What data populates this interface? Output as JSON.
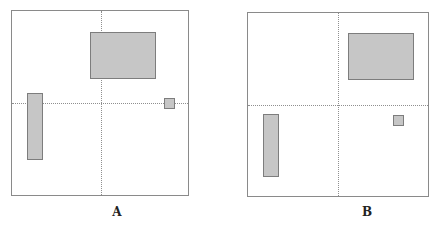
{
  "figure": {
    "shape_fill": "#c6c6c6",
    "shape_border": "#7d7d7d",
    "panels": [
      {
        "label": "A",
        "frame": {
          "x": 11,
          "y": 10,
          "w": 178,
          "h": 186
        },
        "divider_v_x": 89,
        "divider_h_y": 92,
        "label_pos": {
          "x": 117,
          "y": 205
        },
        "shapes": [
          {
            "name": "large-rectangle",
            "x": 78,
            "y": 21,
            "w": 66,
            "h": 47
          },
          {
            "name": "tall-rectangle",
            "x": 15,
            "y": 82,
            "w": 16,
            "h": 67
          },
          {
            "name": "small-square",
            "x": 152,
            "y": 87,
            "w": 11,
            "h": 11
          }
        ]
      },
      {
        "label": "B",
        "frame": {
          "x": 247,
          "y": 12,
          "w": 182,
          "h": 185
        },
        "divider_v_x": 90,
        "divider_h_y": 92,
        "label_pos": {
          "x": 367,
          "y": 205
        },
        "shapes": [
          {
            "name": "large-rectangle",
            "x": 100,
            "y": 20,
            "w": 66,
            "h": 47
          },
          {
            "name": "tall-rectangle",
            "x": 15,
            "y": 101,
            "w": 16,
            "h": 63
          },
          {
            "name": "small-square",
            "x": 145,
            "y": 102,
            "w": 11,
            "h": 11
          }
        ]
      }
    ]
  }
}
